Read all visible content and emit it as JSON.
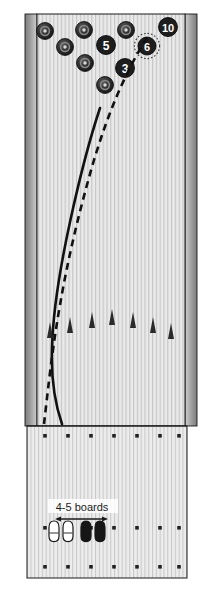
{
  "diagram": {
    "colors": {
      "lane_surface": "#e9e9e9",
      "board_line": "#b9b9b9",
      "gutter_dark": "#6e6e6e",
      "gutter_light": "#c9c9c9",
      "pin_dark": "#2b2b2b",
      "pin_ring": "#555555",
      "outline": "#1a1a1a",
      "path_solid": "#111111",
      "path_dashed": "#111111",
      "shoe_outline": "#1a1a1a",
      "shoe_fill_white": "#ffffff",
      "shoe_fill_black": "#161616",
      "dot_color": "#222222",
      "arrow_color": "#2a2a2a"
    },
    "lane": {
      "name": "pin-deck-and-lane",
      "x": 37,
      "y": 14,
      "width": 148,
      "height": 412,
      "board_count": 39
    },
    "approach": {
      "name": "approach-area",
      "x": 27,
      "y": 426,
      "width": 160,
      "height": 152,
      "board_count": 42
    },
    "gutters": {
      "left": {
        "x": 25,
        "y": 14,
        "width": 12,
        "height": 412
      },
      "right": {
        "x": 185,
        "y": 14,
        "width": 12,
        "height": 412
      }
    },
    "pins": [
      {
        "name": "pin-7",
        "label": "",
        "cx": 45,
        "cy": 31,
        "r": 8.5,
        "numbered": false,
        "highlight": false
      },
      {
        "name": "pin-8",
        "label": "",
        "cx": 84,
        "cy": 30,
        "r": 8.5,
        "numbered": false,
        "highlight": false
      },
      {
        "name": "pin-9",
        "label": "",
        "cx": 126,
        "cy": 30,
        "r": 8.5,
        "numbered": false,
        "highlight": false
      },
      {
        "name": "pin-10",
        "label": "10",
        "cx": 168,
        "cy": 27,
        "r": 9.5,
        "numbered": true,
        "highlight": false
      },
      {
        "name": "pin-4",
        "label": "",
        "cx": 65,
        "cy": 47,
        "r": 8.5,
        "numbered": false,
        "highlight": false
      },
      {
        "name": "pin-5",
        "label": "5",
        "cx": 106,
        "cy": 45,
        "r": 9.5,
        "numbered": true,
        "highlight": false
      },
      {
        "name": "pin-6",
        "label": "6",
        "cx": 147,
        "cy": 46,
        "r": 9.0,
        "numbered": true,
        "highlight": true
      },
      {
        "name": "pin-2",
        "label": "",
        "cx": 85,
        "cy": 63,
        "r": 8.5,
        "numbered": false,
        "highlight": false
      },
      {
        "name": "pin-3",
        "label": "3",
        "cx": 125,
        "cy": 68,
        "r": 9.5,
        "numbered": true,
        "highlight": false
      },
      {
        "name": "pin-1",
        "label": "",
        "cx": 105,
        "cy": 85,
        "r": 8.5,
        "numbered": false,
        "highlight": false
      }
    ],
    "ball_paths": [
      {
        "name": "ball-path-solid",
        "style": "solid",
        "description": "hooking ball path",
        "points": "62,424 56,400 52,370 52,340 56,300 64,255 74,205 86,155 98,110"
      },
      {
        "name": "ball-path-dashed",
        "style": "dashed",
        "description": "straight launch line / target line",
        "dash": "7,5",
        "points": "44,424 48,390 55,340 66,280 80,215 96,150 112,95 133,55 146,37"
      }
    ],
    "target_arrows": [
      {
        "name": "target-arrow-1",
        "x": 50,
        "y": 330
      },
      {
        "name": "target-arrow-2",
        "x": 70,
        "y": 325
      },
      {
        "name": "target-arrow-3",
        "x": 92,
        "y": 320
      },
      {
        "name": "target-arrow-4",
        "x": 112,
        "y": 317
      },
      {
        "name": "target-arrow-5",
        "x": 133,
        "y": 320
      },
      {
        "name": "target-arrow-6",
        "x": 153,
        "y": 325
      },
      {
        "name": "target-arrow-7",
        "x": 171,
        "y": 331
      }
    ],
    "approach_dot_rows": [
      {
        "name": "dot-row-foul-line",
        "y": 436,
        "xs": [
          45,
          68,
          91,
          114,
          137,
          160,
          179
        ]
      },
      {
        "name": "dot-row-middle",
        "y": 528,
        "xs": [
          45,
          68,
          91,
          114,
          137,
          160,
          179
        ]
      },
      {
        "name": "dot-row-rear",
        "y": 567,
        "xs": [
          45,
          68,
          91,
          114,
          137,
          160,
          179
        ]
      }
    ],
    "stance_annotation": {
      "name": "board-offset-annotation",
      "label": "4-5 boards",
      "label_x": 82,
      "label_y": 508,
      "arrow_y": 519,
      "arrow_x1": 57,
      "arrow_x2": 106
    },
    "shoes": [
      {
        "name": "shoe-left-start",
        "x": 54,
        "y": 522,
        "fill": "white"
      },
      {
        "name": "shoe-right-start",
        "x": 68,
        "y": 522,
        "fill": "white"
      },
      {
        "name": "shoe-left-moved",
        "x": 86,
        "y": 522,
        "fill": "black"
      },
      {
        "name": "shoe-right-moved",
        "x": 100,
        "y": 522,
        "fill": "black"
      }
    ]
  }
}
